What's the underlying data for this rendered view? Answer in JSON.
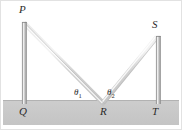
{
  "figure": {
    "width": 182,
    "height": 130,
    "background_color": "#ffffff",
    "border_color": "#e2e2e2"
  },
  "ground": {
    "name": "ground-band",
    "fill_color": "#c9c9c9",
    "top_edge_color": "#b4b4b4",
    "x": 3,
    "y": 100,
    "width": 176,
    "height": 25
  },
  "poles": [
    {
      "name": "left-pole",
      "top_label": "P",
      "base_label": "Q",
      "x": 22.5,
      "top_y": 22,
      "base_y": 104,
      "width": 4,
      "fill_color": "#b9b9b9",
      "highlight_color": "#e8e8e8",
      "edge_color": "#8f8f8f"
    },
    {
      "name": "right-pole",
      "top_label": "S",
      "base_label": "T",
      "x": 156.5,
      "top_y": 36,
      "base_y": 104,
      "width": 4,
      "fill_color": "#b9b9b9",
      "highlight_color": "#e8e8e8",
      "edge_color": "#8f8f8f"
    }
  ],
  "beam": {
    "name": "reflected-beam",
    "color": "#d4d4d4",
    "highlight_color": "#efefef",
    "stroke_width": 4.5,
    "incident_segment": {
      "from": "P",
      "to": "R",
      "x1": 24,
      "y1": 23,
      "x2": 103,
      "y2": 103
    },
    "reflected_segment": {
      "from": "R",
      "to": "S",
      "x1": 103,
      "y1": 103,
      "x2": 157,
      "y2": 37
    }
  },
  "points": {
    "P": {
      "label": "P",
      "x": 24,
      "y": 22
    },
    "Q": {
      "label": "Q",
      "x": 24,
      "y": 104
    },
    "R": {
      "label": "R",
      "x": 103,
      "y": 103
    },
    "S": {
      "label": "S",
      "x": 157,
      "y": 36
    },
    "T": {
      "label": "T",
      "x": 157,
      "y": 104
    }
  },
  "angles": [
    {
      "name": "theta-1",
      "symbol": "θ",
      "subscript": "1",
      "vertex": "R",
      "side": "left"
    },
    {
      "name": "theta-2",
      "symbol": "θ",
      "subscript": "2",
      "vertex": "R",
      "side": "right"
    }
  ]
}
